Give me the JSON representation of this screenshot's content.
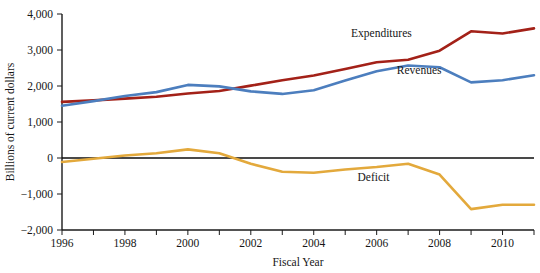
{
  "chart_data": {
    "type": "line",
    "title": "",
    "xlabel": "Fiscal Year",
    "ylabel": "Billions of current dollars",
    "x": [
      1996,
      1997,
      1998,
      1999,
      2000,
      2001,
      2002,
      2003,
      2004,
      2005,
      2006,
      2007,
      2008,
      2009,
      2010,
      2011
    ],
    "xlim": [
      1996,
      2011
    ],
    "ylim": [
      -2000,
      4000
    ],
    "yticks": [
      4000,
      3000,
      2000,
      1000,
      0,
      -1000,
      -2000
    ],
    "ytick_labels": [
      "4,000",
      "3,000",
      "2,000",
      "1,000",
      "0",
      "−1,000",
      "−2,000"
    ],
    "xticks": [
      1996,
      1997,
      1998,
      1999,
      2000,
      2001,
      2002,
      2003,
      2004,
      2005,
      2006,
      2007,
      2008,
      2009,
      2010,
      2011
    ],
    "xtick_labels": [
      "1996",
      "",
      "1998",
      "",
      "2000",
      "",
      "2002",
      "",
      "2004",
      "",
      "2006",
      "",
      "2008",
      "",
      "2010",
      ""
    ],
    "grid": false,
    "legend": "inline-annotations",
    "zero_line": true,
    "series": [
      {
        "name": "Expenditures",
        "color": "#A32118",
        "label_x": 2006.15,
        "label_y": 3360,
        "values": [
          1560,
          1600,
          1650,
          1700,
          1790,
          1860,
          2010,
          2160,
          2290,
          2470,
          2660,
          2730,
          2980,
          3520,
          3460,
          3600
        ]
      },
      {
        "name": "Revenues",
        "color": "#4C7EBE",
        "label_x": 2007.35,
        "label_y": 2340,
        "values": [
          1450,
          1580,
          1720,
          1830,
          2030,
          1990,
          1850,
          1780,
          1880,
          2150,
          2410,
          2570,
          2520,
          2100,
          2160,
          2300
        ]
      },
      {
        "name": "Deficit",
        "color": "#E3A93C",
        "label_x": 2005.9,
        "label_y": -640,
        "values": [
          -110,
          -20,
          70,
          130,
          240,
          130,
          -160,
          -380,
          -410,
          -320,
          -250,
          -160,
          -460,
          -1420,
          -1300,
          -1300
        ]
      }
    ]
  },
  "axes": {
    "y_axis_title": "Billions of current dollars",
    "x_axis_title": "Fiscal Year"
  }
}
